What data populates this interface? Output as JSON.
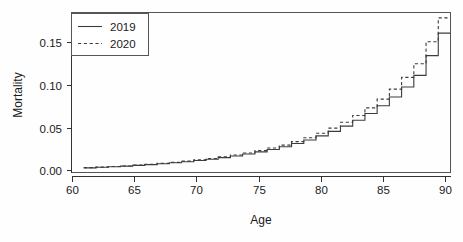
{
  "chart_data": {
    "type": "line",
    "subtype": "step",
    "title": "",
    "xlabel": "Age",
    "ylabel": "Mortality",
    "xlim": [
      60,
      91
    ],
    "ylim": [
      0.0,
      0.178
    ],
    "xticks": [
      60,
      65,
      70,
      75,
      80,
      85,
      90
    ],
    "xtick_labels": [
      "60",
      "65",
      "70",
      "75",
      "80",
      "85",
      "90"
    ],
    "yticks": [
      0.0,
      0.05,
      0.1,
      0.15
    ],
    "ytick_labels": [
      "0.00",
      "0.05",
      "0.10",
      "0.15"
    ],
    "grid": false,
    "legend_position": "top-left",
    "x": [
      61,
      62,
      63,
      64,
      65,
      66,
      67,
      68,
      69,
      70,
      71,
      72,
      73,
      74,
      75,
      76,
      77,
      78,
      79,
      80,
      81,
      82,
      83,
      84,
      85,
      86,
      87,
      88,
      89,
      90
    ],
    "series": [
      {
        "name": "2019",
        "linestyle": "solid",
        "color": "#3c3c3c",
        "values": [
          0.0052,
          0.0058,
          0.0064,
          0.0071,
          0.0079,
          0.0088,
          0.0097,
          0.0108,
          0.012,
          0.0133,
          0.0148,
          0.0165,
          0.0184,
          0.0205,
          0.0229,
          0.0256,
          0.0287,
          0.0322,
          0.0362,
          0.0407,
          0.0458,
          0.0516,
          0.0582,
          0.0657,
          0.0742,
          0.084,
          0.0952,
          0.108,
          0.13,
          0.155
        ]
      },
      {
        "name": "2020",
        "linestyle": "dashed",
        "color": "#3c3c3c",
        "values": [
          0.0054,
          0.006,
          0.0066,
          0.0073,
          0.0082,
          0.0091,
          0.0101,
          0.0113,
          0.0126,
          0.014,
          0.0156,
          0.0174,
          0.0194,
          0.0217,
          0.0243,
          0.0272,
          0.0305,
          0.0343,
          0.0387,
          0.0437,
          0.0494,
          0.0559,
          0.0634,
          0.0719,
          0.0816,
          0.0928,
          0.1058,
          0.121,
          0.1455,
          0.172
        ]
      }
    ],
    "legend": [
      {
        "label": "2019",
        "linestyle": "solid"
      },
      {
        "label": "2020",
        "linestyle": "dashed"
      }
    ]
  }
}
